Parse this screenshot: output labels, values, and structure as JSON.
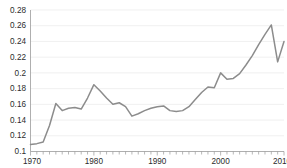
{
  "chart_data": {
    "type": "line",
    "title": "",
    "subtitle": "",
    "xlabel": "",
    "ylabel": "",
    "xlim": [
      1970,
      2010
    ],
    "ylim": [
      0.1,
      0.28
    ],
    "grid": true,
    "legend": false,
    "legend_position": "none",
    "line_color": "#8c8c8c",
    "y_ticks": [
      0.1,
      0.12,
      0.14,
      0.16,
      0.18,
      0.2,
      0.22,
      0.24,
      0.26,
      0.28
    ],
    "y_tick_labels": [
      "0.1",
      "0.12",
      "0.14",
      "0.16",
      "0.18",
      "0.2",
      "0.22",
      "0.24",
      "0.26",
      "0.28"
    ],
    "x_ticks": [
      1970,
      1980,
      1990,
      2000,
      2010
    ],
    "x_tick_labels": [
      "1970",
      "1980",
      "1990",
      "2000",
      "2010"
    ],
    "x_minor_tick_interval": 1,
    "x": [
      1970,
      1971,
      1972,
      1973,
      1974,
      1975,
      1976,
      1977,
      1978,
      1979,
      1980,
      1981,
      1982,
      1983,
      1984,
      1985,
      1986,
      1987,
      1988,
      1989,
      1990,
      1991,
      1992,
      1993,
      1994,
      1995,
      1996,
      1997,
      1998,
      1999,
      2000,
      2001,
      2002,
      2003,
      2004,
      2005,
      2006,
      2007,
      2008,
      2009,
      2010
    ],
    "series": [
      {
        "name": "series-1",
        "color": "#8c8c8c",
        "values": [
          0.109,
          0.11,
          0.112,
          0.133,
          0.161,
          0.152,
          0.155,
          0.156,
          0.154,
          0.168,
          0.185,
          0.177,
          0.168,
          0.16,
          0.162,
          0.157,
          0.145,
          0.148,
          0.152,
          0.155,
          0.157,
          0.158,
          0.152,
          0.151,
          0.152,
          0.157,
          0.166,
          0.175,
          0.182,
          0.181,
          0.2,
          0.192,
          0.193,
          0.199,
          0.21,
          0.222,
          0.236,
          0.249,
          0.261,
          0.214,
          0.24
        ]
      }
    ]
  }
}
